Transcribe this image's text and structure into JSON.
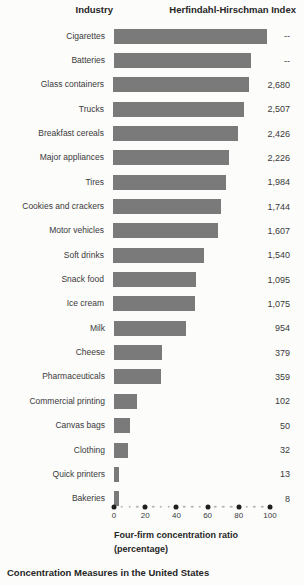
{
  "figure": {
    "header": {
      "industry_label": "Industry",
      "hhi_label": "Herfindahl-Hirschman Index"
    },
    "axis": {
      "ticks": [
        0,
        20,
        40,
        60,
        80,
        100
      ],
      "minor_step": 5,
      "title_line1": "Four-firm concentration ratio",
      "title_line2": "(percentage)"
    },
    "caption": "Concentration Measures in the United States",
    "colors": {
      "bar": "#7a7a7a",
      "major_dot": "#1f1f1f",
      "minor_dot": "#b8b8b8",
      "text": "#3a3a3a"
    }
  },
  "rows": [
    {
      "label": "Cigarettes",
      "hhi": "--",
      "cr4": 98
    },
    {
      "label": "Batteries",
      "hhi": "--",
      "cr4": 88
    },
    {
      "label": "Glass containers",
      "hhi": "2,680",
      "cr4": 88
    },
    {
      "label": "Trucks",
      "hhi": "2,507",
      "cr4": 85
    },
    {
      "label": "Breakfast cereals",
      "hhi": "2,426",
      "cr4": 81
    },
    {
      "label": "Major appliances",
      "hhi": "2,226",
      "cr4": 75
    },
    {
      "label": "Tires",
      "hhi": "1,984",
      "cr4": 73
    },
    {
      "label": "Cookies and crackers",
      "hhi": "1,744",
      "cr4": 70
    },
    {
      "label": "Motor vehicles",
      "hhi": "1,607",
      "cr4": 68
    },
    {
      "label": "Soft drinks",
      "hhi": "1,540",
      "cr4": 59
    },
    {
      "label": "Snack food",
      "hhi": "1,095",
      "cr4": 54
    },
    {
      "label": "Ice cream",
      "hhi": "1,075",
      "cr4": 53
    },
    {
      "label": "Milk",
      "hhi": "954",
      "cr4": 46
    },
    {
      "label": "Cheese",
      "hhi": "379",
      "cr4": 31
    },
    {
      "label": "Pharmaceuticals",
      "hhi": "359",
      "cr4": 30
    },
    {
      "label": "Commercial printing",
      "hhi": "102",
      "cr4": 15
    },
    {
      "label": "Canvas bags",
      "hhi": "50",
      "cr4": 10
    },
    {
      "label": "Clothing",
      "hhi": "32",
      "cr4": 9
    },
    {
      "label": "Quick printers",
      "hhi": "13",
      "cr4": 3
    },
    {
      "label": "Bakeries",
      "hhi": "8",
      "cr4": 3
    }
  ],
  "chart_data": {
    "type": "bar",
    "orientation": "horizontal",
    "title": "Concentration Measures in the United States",
    "xlabel": "Four-firm concentration ratio (percentage)",
    "xlim": [
      0,
      100
    ],
    "x_ticks": [
      0,
      20,
      40,
      60,
      80,
      100
    ],
    "grid": false,
    "legend_position": "none",
    "categories": [
      "Cigarettes",
      "Batteries",
      "Glass containers",
      "Trucks",
      "Breakfast cereals",
      "Major appliances",
      "Tires",
      "Cookies and crackers",
      "Motor vehicles",
      "Soft drinks",
      "Snack food",
      "Ice cream",
      "Milk",
      "Cheese",
      "Pharmaceuticals",
      "Commercial printing",
      "Canvas bags",
      "Clothing",
      "Quick printers",
      "Bakeries"
    ],
    "series": [
      {
        "name": "Four-firm concentration ratio (percentage)",
        "values": [
          98,
          88,
          88,
          85,
          81,
          75,
          73,
          70,
          68,
          59,
          54,
          53,
          46,
          31,
          30,
          15,
          10,
          9,
          3,
          3
        ]
      },
      {
        "name": "Herfindahl-Hirschman Index",
        "values": [
          "--",
          "--",
          "2,680",
          "2,507",
          "2,426",
          "2,226",
          "1,984",
          "1,744",
          "1,607",
          "1,540",
          "1,095",
          "1,075",
          "954",
          "379",
          "359",
          "102",
          "50",
          "32",
          "13",
          "8"
        ]
      }
    ],
    "bar_color": "#7a7a7a"
  }
}
